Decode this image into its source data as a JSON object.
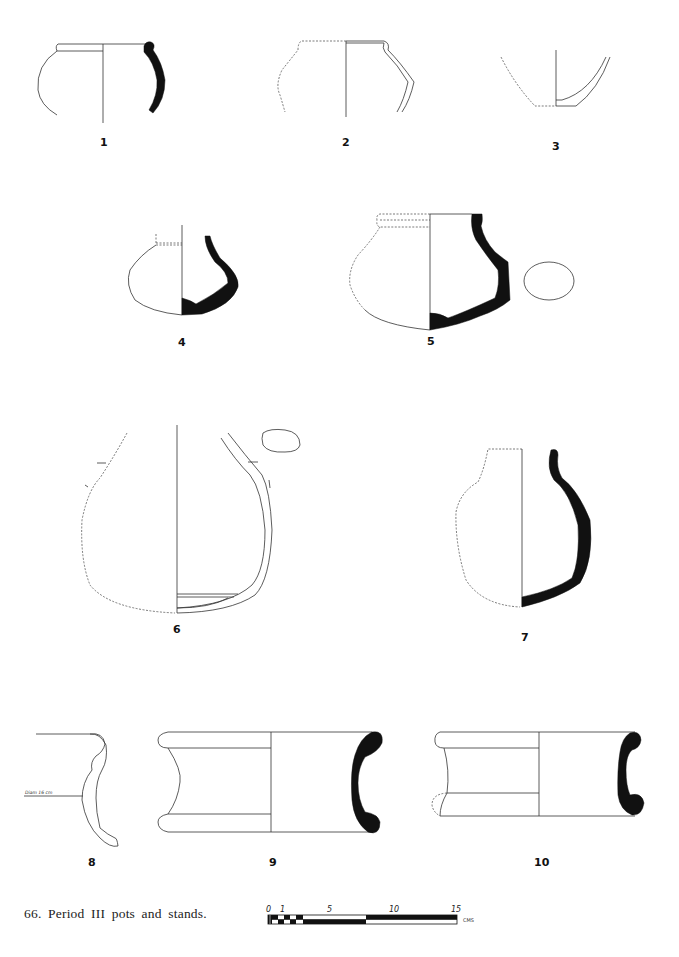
{
  "figure": {
    "caption": "66. Period III pots and stands.",
    "items": [
      {
        "number": "1"
      },
      {
        "number": "2"
      },
      {
        "number": "3"
      },
      {
        "number": "4"
      },
      {
        "number": "5"
      },
      {
        "number": "6"
      },
      {
        "number": "7"
      },
      {
        "number": "8",
        "annotation": "Diam 16 cm"
      },
      {
        "number": "9"
      },
      {
        "number": "10"
      }
    ]
  },
  "scale_bar": {
    "labels": [
      "0",
      "1",
      "5",
      "10",
      "15"
    ],
    "units": "CMS"
  }
}
